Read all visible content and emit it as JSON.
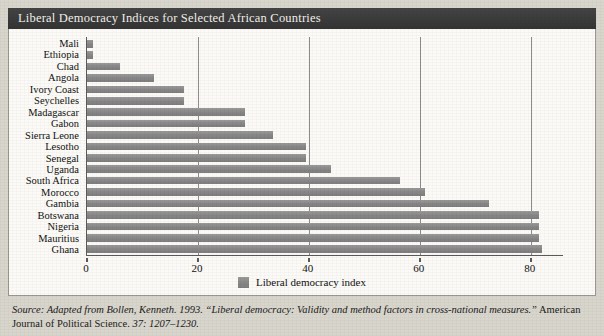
{
  "figure": {
    "title": "Liberal Democracy Indices for Selected African Countries"
  },
  "legend": {
    "label": "Liberal democracy index",
    "swatch_color": "#8b8b8b"
  },
  "source": {
    "label": "Source:",
    "text_italic": " Adapted from Bollen, Kenneth. 1993. “Liberal democracy: Validity and method factors in cross-national measures.”",
    "text_roman": " American Journal of Political Science. ",
    "text_tail_italic": "37: 1207–1230."
  },
  "chart_data": {
    "type": "bar",
    "orientation": "horizontal",
    "title": "Liberal Democracy Indices for Selected African Countries",
    "xlabel": "",
    "ylabel": "",
    "xlim": [
      0,
      86
    ],
    "ylim": null,
    "grid": true,
    "legend_position": "bottom",
    "xticks": [
      0,
      20,
      40,
      60,
      80
    ],
    "xtick_labels": [
      "0",
      "20",
      "40",
      "60",
      "80"
    ],
    "series_name": "Liberal democracy index",
    "series_color": "#8b8b8b",
    "categories": [
      "Mali",
      "Ethiopia",
      "Chad",
      "Angola",
      "Ivory Coast",
      "Seychelles",
      "Madagascar",
      "Gabon",
      "Sierra Leone",
      "Lesotho",
      "Senegal",
      "Uganda",
      "South Africa",
      "Morocco",
      "Gambia",
      "Botswana",
      "Nigeria",
      "Mauritius",
      "Ghana"
    ],
    "values": [
      1,
      1,
      6,
      12,
      17.5,
      17.5,
      28.5,
      28.5,
      33.5,
      39.5,
      39.5,
      44,
      56.5,
      61,
      72.5,
      81.5,
      81.5,
      81.5,
      82
    ]
  }
}
